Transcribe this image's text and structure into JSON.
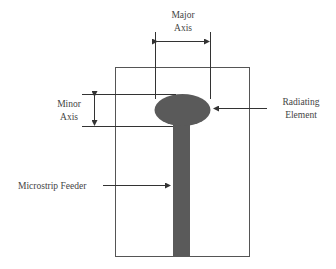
{
  "labels": {
    "major_axis_line1": "Major",
    "major_axis_line2": "Axis",
    "minor_axis_line1": "Minor",
    "minor_axis_line2": "Axis",
    "radiating_line1": "Radiating",
    "radiating_line2": "Element",
    "feeder": "Microstrip Feeder"
  },
  "colors": {
    "patch": "#5a5a5a",
    "line": "#333333",
    "substrate_border": "#555555"
  }
}
